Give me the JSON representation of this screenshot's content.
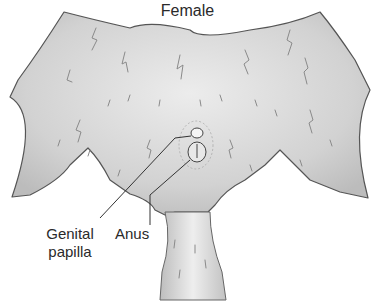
{
  "diagram": {
    "title": "Female",
    "labels": [
      {
        "id": "genital_papilla",
        "text_line1": "Genital",
        "text_line2": "papilla"
      },
      {
        "id": "anus",
        "text": "Anus"
      }
    ],
    "colors": {
      "fur_fill": "#d4d4d4",
      "fur_shadow": "#b8b8b8",
      "outline": "#555555",
      "hair_strokes": "#8a8a8a",
      "leader_line": "#333333",
      "text": "#2a2a2a",
      "background": "#ffffff"
    }
  }
}
